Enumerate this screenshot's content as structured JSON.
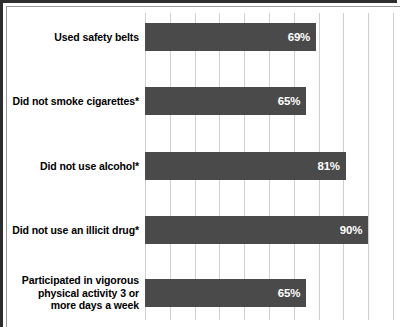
{
  "chart_data": {
    "type": "bar",
    "orientation": "horizontal",
    "title": "",
    "xlabel": "",
    "ylabel": "",
    "xlim": [
      0,
      100
    ],
    "grid": true,
    "gridline_interval": 10,
    "legend": "none",
    "value_suffix": "%",
    "bar_color": "#4a4a4a",
    "categories": [
      "Used safety belts",
      "Did not smoke cigarettes*",
      "Did not use alcohol*",
      "Did not use an illicit drug*",
      "Participated in vigorous physical activity 3 or more days a week"
    ],
    "values": [
      69,
      65,
      81,
      90,
      65
    ],
    "value_labels": [
      "69%",
      "65%",
      "81%",
      "90%",
      "65%"
    ]
  },
  "chart": {
    "rows": [
      {
        "label_lines": [
          "Used safety belts"
        ],
        "value": 69,
        "value_label": "69%"
      },
      {
        "label_lines": [
          "Did not smoke cigarettes*"
        ],
        "value": 65,
        "value_label": "65%"
      },
      {
        "label_lines": [
          "Did not use alcohol*"
        ],
        "value": 81,
        "value_label": "81%"
      },
      {
        "label_lines": [
          "Did not use an illicit drug*"
        ],
        "value": 90,
        "value_label": "90%"
      },
      {
        "label_lines": [
          "Participated in vigorous",
          "physical activity 3 or",
          "more days a week"
        ],
        "value": 65,
        "value_label": "65%"
      }
    ]
  },
  "colors": {
    "bar": "#4a4a4a",
    "gridline": "#cfcfcf",
    "frame": "#2e2e2e",
    "label_text": "#000000",
    "value_text": "#ffffff",
    "background": "#ffffff"
  }
}
